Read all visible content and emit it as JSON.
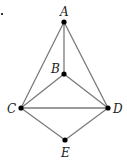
{
  "diagram": {
    "type": "graph",
    "marker": ".",
    "nodes": [
      {
        "id": "A",
        "label": "A",
        "x": 64,
        "y": 22
      },
      {
        "id": "B",
        "label": "B",
        "x": 64,
        "y": 74
      },
      {
        "id": "C",
        "label": "C",
        "x": 21,
        "y": 108
      },
      {
        "id": "D",
        "label": "D",
        "x": 108,
        "y": 108
      },
      {
        "id": "E",
        "label": "E",
        "x": 65,
        "y": 140
      }
    ],
    "edges": [
      [
        "A",
        "B"
      ],
      [
        "A",
        "C"
      ],
      [
        "A",
        "D"
      ],
      [
        "B",
        "C"
      ],
      [
        "B",
        "D"
      ],
      [
        "C",
        "D"
      ],
      [
        "C",
        "E"
      ],
      [
        "D",
        "E"
      ]
    ],
    "colors": {
      "edge": "#7a7a7a",
      "node": "#000000",
      "label": "#222222"
    }
  }
}
